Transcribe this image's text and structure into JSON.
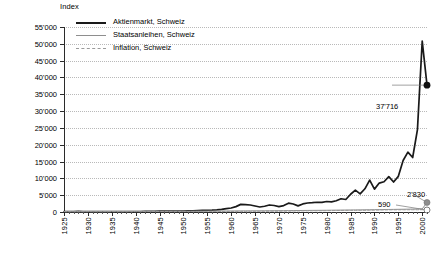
{
  "chart_data": {
    "type": "line",
    "title": "",
    "xlabel": "",
    "ylabel": "Index",
    "xlim": [
      1925,
      2001
    ],
    "ylim": [
      0,
      55000
    ],
    "ytick_step": 5000,
    "xtick_step": 5,
    "grid": "horizontal-dotted",
    "legend_position": "top-left",
    "ytick_labels": [
      "0",
      "5'000",
      "10'000",
      "15'000",
      "20'000",
      "25'000",
      "30'000",
      "35'000",
      "40'000",
      "45'000",
      "50'000",
      "55'000"
    ],
    "ytick_values": [
      0,
      5000,
      10000,
      15000,
      20000,
      25000,
      30000,
      35000,
      40000,
      45000,
      50000,
      55000
    ],
    "xtick_labels": [
      "1925",
      "1930",
      "1935",
      "1940",
      "1945",
      "1950",
      "1955",
      "1960",
      "1965",
      "1970",
      "1975",
      "1980",
      "1985",
      "1990",
      "1995",
      "2000"
    ],
    "xtick_values": [
      1925,
      1930,
      1935,
      1940,
      1945,
      1950,
      1955,
      1960,
      1965,
      1970,
      1975,
      1980,
      1985,
      1990,
      1995,
      2000
    ],
    "x": [
      1925,
      1926,
      1927,
      1928,
      1929,
      1930,
      1931,
      1932,
      1933,
      1934,
      1935,
      1936,
      1937,
      1938,
      1939,
      1940,
      1941,
      1942,
      1943,
      1944,
      1945,
      1946,
      1947,
      1948,
      1949,
      1950,
      1951,
      1952,
      1953,
      1954,
      1955,
      1956,
      1957,
      1958,
      1959,
      1960,
      1961,
      1962,
      1963,
      1964,
      1965,
      1966,
      1967,
      1968,
      1969,
      1970,
      1971,
      1972,
      1973,
      1974,
      1975,
      1976,
      1977,
      1978,
      1979,
      1980,
      1981,
      1982,
      1983,
      1984,
      1985,
      1986,
      1987,
      1988,
      1989,
      1990,
      1991,
      1992,
      1993,
      1994,
      1995,
      1996,
      1997,
      1998,
      1999,
      2000,
      2001
    ],
    "series": [
      {
        "name": "Aktienmarkt, Schweiz",
        "color": "#1a1a1a",
        "style": "solid-thick",
        "end_marker": "filled-circle",
        "end_label": "37'716",
        "end_value": 37716,
        "values": [
          100,
          118,
          140,
          165,
          150,
          128,
          96,
          84,
          101,
          108,
          124,
          140,
          150,
          138,
          130,
          122,
          150,
          168,
          185,
          205,
          232,
          258,
          255,
          250,
          268,
          290,
          320,
          345,
          395,
          470,
          520,
          545,
          610,
          760,
          1010,
          1180,
          1600,
          2270,
          2190,
          2080,
          1780,
          1480,
          1700,
          2090,
          1930,
          1620,
          1900,
          2620,
          2380,
          1810,
          2400,
          2680,
          2760,
          2900,
          2850,
          3120,
          3000,
          3340,
          3930,
          3710,
          5280,
          6500,
          5400,
          6900,
          9500,
          6800,
          8600,
          9000,
          10500,
          8900,
          10600,
          15300,
          17800,
          16200,
          24500,
          50800,
          37716
        ]
      },
      {
        "name": "Staatsanleihen, Schweiz",
        "color": "#8e8e8e",
        "style": "solid-thin",
        "end_marker": "filled-circle-gray",
        "end_label": "2'830",
        "end_value": 2830,
        "values": [
          100,
          104,
          108,
          112,
          116,
          121,
          126,
          131,
          136,
          141,
          146,
          151,
          157,
          162,
          168,
          173,
          178,
          184,
          189,
          195,
          201,
          207,
          213,
          219,
          226,
          232,
          238,
          245,
          252,
          259,
          266,
          273,
          280,
          288,
          296,
          304,
          312,
          320,
          329,
          338,
          347,
          356,
          366,
          376,
          386,
          396,
          407,
          418,
          429,
          441,
          453,
          466,
          479,
          492,
          506,
          520,
          535,
          550,
          566,
          582,
          599,
          616,
          634,
          652,
          671,
          690,
          710,
          731,
          752,
          774,
          797,
          820,
          844,
          869,
          895,
          921,
          2830
        ]
      },
      {
        "name": "Inflation, Schweiz",
        "color": "#9a9a9a",
        "style": "dashed",
        "end_marker": "open-circle",
        "end_label": "590",
        "end_value": 590,
        "values": [
          100,
          101,
          102,
          103,
          103,
          101,
          98,
          94,
          91,
          90,
          90,
          91,
          93,
          94,
          97,
          104,
          117,
          130,
          136,
          139,
          141,
          143,
          146,
          149,
          149,
          150,
          157,
          161,
          163,
          164,
          166,
          169,
          173,
          176,
          178,
          180,
          183,
          190,
          196,
          203,
          210,
          218,
          227,
          234,
          240,
          249,
          266,
          283,
          304,
          327,
          350,
          360,
          365,
          369,
          382,
          397,
          419,
          448,
          462,
          476,
          492,
          491,
          497,
          507,
          525,
          555,
          588,
          613,
          633,
          638,
          650,
          656,
          660,
          660,
          665,
          680,
          590
        ]
      }
    ]
  },
  "axis": {
    "y_title": "Index"
  },
  "legend": {
    "items": [
      {
        "label": "Aktienmarkt, Schweiz"
      },
      {
        "label": "Staatsanleihen, Schweiz"
      },
      {
        "label": "Inflation, Schweiz"
      }
    ]
  },
  "annotations": {
    "stocks_label": "37'716",
    "bonds_label": "2'830",
    "inflation_label": "590"
  }
}
